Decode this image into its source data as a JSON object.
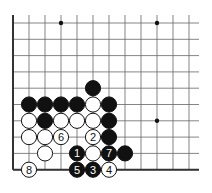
{
  "board": {
    "x0": 13,
    "y0": 23,
    "dx": 16,
    "dy": 16.3,
    "cols": 12,
    "rows": 10,
    "right_edge": 199,
    "top_open": true,
    "right_open": true
  },
  "stars": [
    [
      3,
      0
    ],
    [
      9,
      0
    ],
    [
      9,
      6
    ]
  ],
  "stones": [
    {
      "c": 5,
      "r": 4,
      "color": "B"
    },
    {
      "c": 1,
      "r": 5,
      "color": "B"
    },
    {
      "c": 2,
      "r": 5,
      "color": "B"
    },
    {
      "c": 3,
      "r": 5,
      "color": "B"
    },
    {
      "c": 4,
      "r": 5,
      "color": "B"
    },
    {
      "c": 5,
      "r": 5,
      "color": "W"
    },
    {
      "c": 6,
      "r": 5,
      "color": "B"
    },
    {
      "c": 1,
      "r": 6,
      "color": "W"
    },
    {
      "c": 2,
      "r": 6,
      "color": "B"
    },
    {
      "c": 3,
      "r": 6,
      "color": "W"
    },
    {
      "c": 4,
      "r": 6,
      "color": "W"
    },
    {
      "c": 5,
      "r": 6,
      "color": "W"
    },
    {
      "c": 6,
      "r": 6,
      "color": "B"
    },
    {
      "c": 1,
      "r": 7,
      "color": "W"
    },
    {
      "c": 2,
      "r": 7,
      "color": "W"
    },
    {
      "c": 3,
      "r": 7,
      "color": "W",
      "label": "6"
    },
    {
      "c": 5,
      "r": 7,
      "color": "W",
      "label": "2"
    },
    {
      "c": 6,
      "r": 7,
      "color": "B"
    },
    {
      "c": 2,
      "r": 8,
      "color": "W"
    },
    {
      "c": 4,
      "r": 8,
      "color": "B",
      "label": "1"
    },
    {
      "c": 5,
      "r": 8,
      "color": "W"
    },
    {
      "c": 6,
      "r": 8,
      "color": "B",
      "label": "7"
    },
    {
      "c": 7,
      "r": 8,
      "color": "B"
    },
    {
      "c": 1,
      "r": 9,
      "color": "W",
      "label": "8"
    },
    {
      "c": 4,
      "r": 9,
      "color": "B",
      "label": "5"
    },
    {
      "c": 5,
      "r": 9,
      "color": "B",
      "label": "3"
    },
    {
      "c": 6,
      "r": 9,
      "color": "W",
      "label": "4"
    }
  ]
}
